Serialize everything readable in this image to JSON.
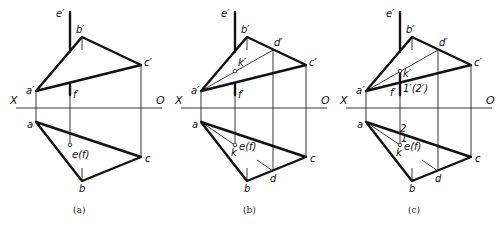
{
  "figure": {
    "panels": [
      {
        "id": "a",
        "caption": "(a)",
        "labels": {
          "e_prime": "e′",
          "b_prime": "b′",
          "c_prime": "c′",
          "a_prime": "a′",
          "f_prime": "f′",
          "X": "X",
          "O": "O",
          "a": "a",
          "b": "b",
          "c": "c",
          "ef": "e(f)"
        }
      },
      {
        "id": "b",
        "caption": "(b)",
        "labels": {
          "e_prime": "e′",
          "b_prime": "b′",
          "d_prime": "d′",
          "c_prime": "c′",
          "k_prime": "k′",
          "a_prime": "a′",
          "f_prime": "f′",
          "X": "X",
          "O": "O",
          "a": "a",
          "k": "k",
          "ef": "e(f)",
          "b": "b",
          "d": "d",
          "c": "c"
        }
      },
      {
        "id": "c",
        "caption": "(c)",
        "labels": {
          "e_prime": "e′",
          "b_prime": "b′",
          "d_prime": "d′",
          "c_prime": "c′",
          "k_prime": "k′",
          "a_prime": "a′",
          "f_prime": "f′",
          "one_two_prime": "1′(2′)",
          "X": "X",
          "O": "O",
          "a": "a",
          "two": "2",
          "one": "1",
          "k": "k",
          "ef": "e(f)",
          "b": "b",
          "d": "d",
          "c": "c"
        }
      }
    ]
  }
}
